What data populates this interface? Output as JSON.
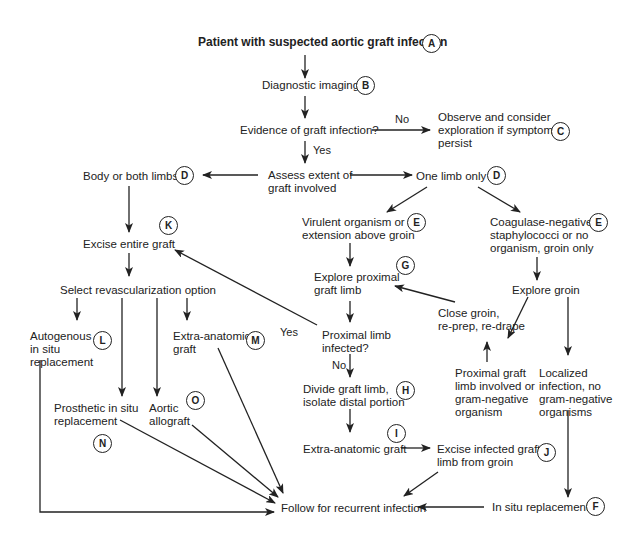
{
  "title": "Patient with suspected aortic graft infection",
  "nodes": {
    "A": {
      "text": "Patient with suspected aortic graft infection",
      "badge": "A"
    },
    "B": {
      "text": "Diagnostic imaging",
      "badge": "B"
    },
    "evidence": {
      "text": "Evidence of graft infection?"
    },
    "C": {
      "text": "Observe and consider\nexploration if symptoms\npersist",
      "badge": "C"
    },
    "assess": {
      "text": "Assess extent of\ngraft involved"
    },
    "D_left": {
      "text": "Body or both limbs",
      "badge": "D"
    },
    "D_right": {
      "text": "One limb only",
      "badge": "D"
    },
    "E_left": {
      "text": "Virulent organism or\nextension above groin",
      "badge": "E"
    },
    "E_right": {
      "text": "Coagulase-negative\nstaphylococci or no\norganism, groin only",
      "badge": "E"
    },
    "K": {
      "text": "Excise entire graft",
      "badge": "K"
    },
    "G": {
      "text": "Explore proximal\ngraft limb",
      "badge": "G"
    },
    "explore_groin": {
      "text": "Explore groin"
    },
    "select": {
      "text": "Select revascularization option"
    },
    "close_groin": {
      "text": "Close groin,\nre-prep, re-drape"
    },
    "L": {
      "text": "Autogenous\nin situ\nreplacement",
      "badge": "L"
    },
    "M": {
      "text": "Extra-anatomic\ngraft",
      "badge": "M"
    },
    "proximal_infected": {
      "text": "Proximal limb\ninfected?"
    },
    "proximal_involved": {
      "text": "Proximal graft\nlimb involved or\ngram-negative\norganism"
    },
    "localized": {
      "text": "Localized\ninfection, no\ngram-negative\norganisms"
    },
    "N": {
      "text": "Prosthetic in situ\nreplacement",
      "badge": "N"
    },
    "O": {
      "text": "Aortic\nallograft",
      "badge": "O"
    },
    "H": {
      "text": "Divide graft limb,\nisolate distal portion",
      "badge": "H"
    },
    "I": {
      "text": "Extra-anatomic graft",
      "badge": "I"
    },
    "J": {
      "text": "Excise infected graft\nlimb from groin",
      "badge": "J"
    },
    "follow": {
      "text": "Follow for recurrent infection"
    },
    "F": {
      "text": "In situ replacement",
      "badge": "F"
    }
  },
  "edge_labels": {
    "no_evidence": "No",
    "yes_evidence": "Yes",
    "yes_proximal": "Yes",
    "no_proximal": "No"
  },
  "colors": {
    "line": "#222222",
    "text": "#222222",
    "background": "#ffffff"
  }
}
